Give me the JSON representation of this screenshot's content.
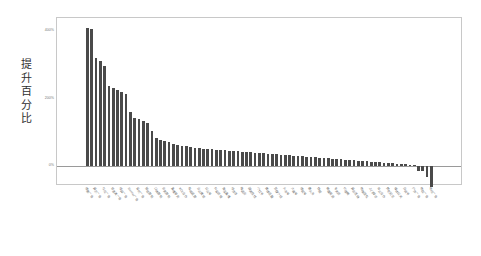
{
  "chart_data": {
    "type": "bar",
    "title": "",
    "subtitle": "",
    "xlabel": "",
    "ylabel": "提升百分比",
    "ylabel_chars": [
      "提",
      "升",
      "百",
      "分",
      "比"
    ],
    "ylim": [
      -60,
      440
    ],
    "yticks": [
      0,
      200,
      400
    ],
    "ytick_labels": [
      "0%",
      "200%",
      "400%"
    ],
    "grid": false,
    "legend": null,
    "bar_color": "#4a4a4a",
    "frame_color": "#c8c8c8",
    "zero_line_color": "#9a9a9a",
    "categories": [
      "搜索广告",
      "购物广告",
      "展示广告",
      "视频广告",
      "社交广告",
      "原生广告",
      "信息流广告",
      "开屏广告",
      "插屏广告",
      "激励视频",
      "Banner广告",
      "富媒体广告",
      "音频广告",
      "邮件营销",
      "短信营销",
      "内容营销",
      "口碑营销",
      "事件营销",
      "会员营销",
      "联盟营销",
      "直播带货",
      "短视频种草",
      "KOL合作",
      "KOC合作",
      "私域运营",
      "社群运营",
      "企业微信",
      "小程序",
      "公众号",
      "视频号",
      "抖音店铺",
      "快手小店",
      "淘宝直播",
      "京东自营",
      "拼多多",
      "天猫旗舰",
      "唯品会",
      "苏宁易购",
      "国美在线",
      "网易严选",
      "小红书",
      "知乎问答",
      "微博话题",
      "百度贴吧",
      "豆瓣小组",
      "B站投稿",
      "头条号",
      "百家号",
      "大鱼号",
      "企鹅号",
      "搜狐号",
      "一点资讯",
      "趣头条",
      "UC订阅",
      "快报",
      "线下门店",
      "商超渠道",
      "便利店",
      "专卖店",
      "经销商",
      "代理商",
      "批发市场",
      "展会活动",
      "路演推广",
      "地推团队",
      "电话营销",
      "上门拜访",
      "老客转介",
      "异业合作",
      "跨界联名",
      "赞助冠名",
      "公益活动",
      "媒体公关",
      "行业峰会",
      "白皮书",
      "Media Buying",
      "户外广告",
      "电梯广告",
      "地铁广告",
      "机场广告",
      "电视广告",
      "广播广告"
    ],
    "values": [
      410,
      408,
      320,
      312,
      296,
      238,
      232,
      226,
      220,
      214,
      160,
      142,
      138,
      134,
      128,
      104,
      82,
      78,
      74,
      70,
      66,
      62,
      60,
      58,
      56,
      54,
      52,
      51,
      50,
      49,
      48,
      47,
      46,
      45,
      44,
      43,
      42,
      41,
      40,
      39,
      38,
      37,
      36,
      35,
      34,
      33,
      32,
      31,
      30,
      29,
      28,
      27,
      26,
      25,
      24,
      23,
      22,
      21,
      20,
      19,
      18,
      17,
      16,
      15,
      14,
      13,
      12,
      11,
      10,
      9,
      8,
      7,
      6,
      5,
      4,
      3,
      2,
      -14,
      -16,
      -34,
      -62,
      0
    ],
    "n_bars": 82
  }
}
